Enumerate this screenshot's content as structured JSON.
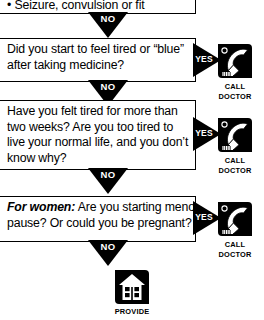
{
  "document": {
    "title": "Fatigue / Tiredness symptom decision flowchart",
    "type": "medical-self-care-flowchart",
    "colors": {
      "ink": "#000000",
      "paper": "#ffffff"
    }
  },
  "flow": {
    "top_box": {
      "name": "symptom-bullet-box",
      "clipped": true,
      "lines": [
        "• Seizure, convulsion or fit"
      ]
    },
    "questions": [
      {
        "id": "q1",
        "lines": [
          "Did you start to feel tired or “blue”",
          "after taking medicine?"
        ],
        "yes_action": "call-doctor",
        "no_action": "continue"
      },
      {
        "id": "q2",
        "lines": [
          "Have you felt tired for more than",
          "two weeks? Are you too tired to",
          "live your normal life, and you don’t",
          "know why?"
        ],
        "yes_action": "call-doctor",
        "no_action": "continue"
      },
      {
        "id": "q3",
        "lead_italic": "For women:",
        "lines": [
          " Are you starting meno-",
          "pause? Or could you be pregnant?"
        ],
        "yes_action": "call-doctor",
        "no_action": "provide-self-care"
      }
    ],
    "arrows": {
      "no_label": "NO",
      "yes_label": "YES",
      "no_count": 4,
      "yes_count": 3
    },
    "actions": [
      {
        "id": "call-1",
        "icon": "telephone-icon",
        "caption_line1": "CALL",
        "caption_line2": "DOCTOR"
      },
      {
        "id": "call-2",
        "icon": "telephone-icon",
        "caption_line1": "CALL",
        "caption_line2": "DOCTOR"
      },
      {
        "id": "call-3",
        "icon": "telephone-icon",
        "caption_line1": "CALL",
        "caption_line2": "DOCTOR"
      },
      {
        "id": "provide",
        "icon": "house-icon",
        "caption_line1": "PROVIDE",
        "caption_line2": ""
      }
    ]
  }
}
